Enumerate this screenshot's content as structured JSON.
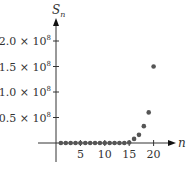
{
  "chart_data": {
    "type": "scatter",
    "title": "",
    "xlabel": "n",
    "ylabel": "S_n",
    "ylabel_main": "S",
    "ylabel_sub": "n",
    "x_ticks": [
      5,
      10,
      15,
      20
    ],
    "y_ticks": [
      {
        "value": 50000000.0,
        "label": "0.5 × 10",
        "exp": "8"
      },
      {
        "value": 100000000.0,
        "label": "1.0 × 10",
        "exp": "8"
      },
      {
        "value": 150000000.0,
        "label": "1.5 × 10",
        "exp": "8"
      },
      {
        "value": 200000000.0,
        "label": "2.0 × 10",
        "exp": "8"
      }
    ],
    "xlim": [
      0,
      22
    ],
    "ylim": [
      0,
      210000000.0
    ],
    "grid": false,
    "legend": null,
    "x": [
      1,
      2,
      3,
      4,
      5,
      6,
      7,
      8,
      9,
      10,
      11,
      12,
      13,
      14,
      15,
      16,
      17,
      18,
      19,
      20
    ],
    "values": [
      0,
      0,
      0,
      0,
      0,
      0,
      0,
      0,
      0,
      0,
      0,
      0,
      0,
      0,
      1000000.0,
      8000000.0,
      16000000.0,
      33000000.0,
      60000000.0,
      150000000.0
    ],
    "point_color": "#555555"
  }
}
